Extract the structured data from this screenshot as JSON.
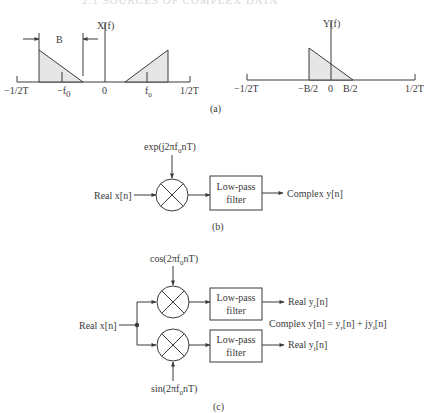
{
  "header": {
    "partial_title": "2.1 SOURCES OF COMPLEX DATA"
  },
  "panel_a": {
    "caption": "(a)",
    "left_plot": {
      "title": "X(f)",
      "bandwidth_label": "B",
      "ticks": [
        "−1/2T",
        "−f",
        "0",
        "f",
        "1/2T"
      ],
      "tick_subscripts": [
        "",
        "0",
        "",
        "0",
        ""
      ]
    },
    "right_plot": {
      "title": "Y(f)",
      "ticks": [
        "−1/2T",
        "−B/2",
        "0",
        "B/2",
        "1/2T"
      ]
    }
  },
  "panel_b": {
    "caption": "(b)",
    "input_label": "Real x[n]",
    "oscillator_label": "exp(j2πf",
    "oscillator_sub": "0",
    "oscillator_tail": "nT)",
    "filter_line1": "Low-pass",
    "filter_line2": "filter",
    "output_label": "Complex y[n]"
  },
  "panel_c": {
    "caption": "(c)",
    "input_label": "Real x[n]",
    "cos_label": "cos(2πf",
    "cos_sub": "0",
    "cos_tail": "nT)",
    "sin_label": "sin(2πf",
    "sin_sub": "0",
    "sin_tail": "nT)",
    "filter_line1": "Low-pass",
    "filter_line2": "filter",
    "out_top": "Real y",
    "out_top_sub": "r",
    "out_top_tail": "[n]",
    "out_bottom": "Real y",
    "out_bottom_sub": "i",
    "out_bottom_tail": "[n]",
    "eq_a": "Complex y[n] = y",
    "eq_sub1": "r",
    "eq_b": "[n] + jy",
    "eq_sub2": "i",
    "eq_c": "[n]"
  }
}
